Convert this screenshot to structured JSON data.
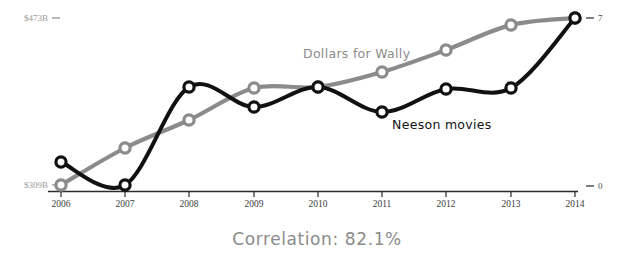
{
  "chart_data": {
    "type": "line",
    "title": "",
    "caption": "Correlation: 82.1%",
    "xlabel": "",
    "grid": false,
    "legend_position": "inline-annotation",
    "categories": [
      "2006",
      "2007",
      "2008",
      "2009",
      "2010",
      "2011",
      "2012",
      "2013",
      "2014"
    ],
    "x_tick_labels": [
      "2006",
      "2007",
      "2008",
      "2009",
      "2010",
      "2011",
      "2012",
      "2013",
      "2014"
    ],
    "axes": {
      "left": {
        "label": "",
        "color": "#8b8b8b",
        "tick_labels": [
          "$309B",
          "$473B"
        ],
        "min_label": "$309B",
        "max_label": "$473B",
        "min": 309,
        "max": 473,
        "unit": "B"
      },
      "right": {
        "label": "",
        "color": "#222222",
        "tick_labels": [
          "0",
          "7"
        ],
        "min_label": "0",
        "max_label": "7",
        "min": 0,
        "max": 7
      }
    },
    "series": [
      {
        "name": "Dollars for Wally",
        "axis": "left",
        "color": "#8b8b8b",
        "marker": "open-circle",
        "values": [
          309,
          345,
          373,
          404,
          412,
          428,
          450,
          466,
          473
        ],
        "points_px": [
          {
            "x": 61,
            "y": 185
          },
          {
            "x": 125,
            "y": 148
          },
          {
            "x": 189,
            "y": 120
          },
          {
            "x": 254,
            "y": 88
          },
          {
            "x": 318,
            "y": 87
          },
          {
            "x": 382,
            "y": 72
          },
          {
            "x": 446,
            "y": 50
          },
          {
            "x": 511,
            "y": 25
          },
          {
            "x": 575,
            "y": 18
          }
        ]
      },
      {
        "name": "Neeson movies",
        "axis": "right",
        "color": "#111111",
        "marker": "open-circle",
        "values": [
          1.2,
          0.25,
          4.4,
          3.6,
          4.4,
          3.3,
          4.3,
          4.4,
          7.0
        ],
        "points_px": [
          {
            "x": 61,
            "y": 162
          },
          {
            "x": 125,
            "y": 185
          },
          {
            "x": 189,
            "y": 87
          },
          {
            "x": 254,
            "y": 107
          },
          {
            "x": 318,
            "y": 87
          },
          {
            "x": 382,
            "y": 112
          },
          {
            "x": 446,
            "y": 89
          },
          {
            "x": 511,
            "y": 88
          },
          {
            "x": 575,
            "y": 18
          }
        ]
      }
    ],
    "annotations": [
      {
        "text": "Dollars for Wally",
        "x": 303,
        "y": 58,
        "color": "#8b8b8b"
      },
      {
        "text": "Neeson movies",
        "x": 392,
        "y": 129,
        "color": "#111111"
      }
    ]
  }
}
